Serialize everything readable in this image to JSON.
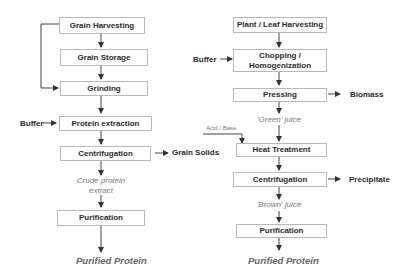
{
  "grain_process": {
    "steps": [
      {
        "label": "Grain Harvesting"
      },
      {
        "label": "Grain Storage"
      },
      {
        "label": "Grinding"
      },
      {
        "label": "Protein extraction"
      },
      {
        "label": "Centrifugation"
      },
      {
        "label": "Purification"
      }
    ],
    "inputs": {
      "buffer": "Buffer"
    },
    "outputs": {
      "grain_solids": "Grain Solids"
    },
    "intermediates": {
      "crude_extract_line1": "Crude protein",
      "crude_extract_line2": "extract"
    },
    "final_product": "Purified Protein"
  },
  "leaf_process": {
    "steps": [
      {
        "label": "Plant / Leaf Harvesting"
      },
      {
        "label_line1": "Chopping /",
        "label_line2": "Homogenization"
      },
      {
        "label": "Pressing"
      },
      {
        "label": "Heat Treatment"
      },
      {
        "label": "Centrifugation"
      },
      {
        "label": "Purification"
      }
    ],
    "inputs": {
      "buffer": "Buffer",
      "acid_base": "Acid / Base"
    },
    "outputs": {
      "biomass": "Biomass",
      "precipitate": "Precipitate"
    },
    "intermediates": {
      "green_juice": "'Green' juice",
      "brown_juice": "'Brown'  juice"
    },
    "final_product": "Purified Protein"
  }
}
